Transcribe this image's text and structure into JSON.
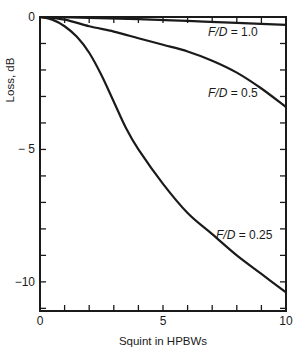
{
  "chart_data": {
    "type": "line",
    "title": "",
    "xlabel": "Squint in HPBWs",
    "ylabel": "Loss, dB",
    "xlim": [
      0,
      10
    ],
    "ylim": [
      -11.1,
      0
    ],
    "x_ticks": [
      0,
      5,
      10
    ],
    "x_tick_labels": [
      "0",
      "5",
      "10"
    ],
    "x_minor_step": 1,
    "y_ticks": [
      0,
      -5,
      -10
    ],
    "y_tick_labels": [
      "0",
      "− 5",
      "−10"
    ],
    "y_minor_step": 1,
    "grid": false,
    "legend": "inline labels",
    "series": [
      {
        "name": "F/D = 1.0",
        "label_italic": "F/D",
        "label_value": " = 1.0",
        "x": [
          0,
          2,
          4,
          6,
          8,
          10
        ],
        "values": [
          0,
          -0.03,
          -0.08,
          -0.15,
          -0.22,
          -0.3
        ],
        "label_pos": [
          208,
          36
        ]
      },
      {
        "name": "F/D = 0.5",
        "label_italic": "F/D",
        "label_value": " = 0.5",
        "x": [
          0,
          1,
          2,
          3,
          4,
          5,
          6,
          7,
          8,
          9,
          10
        ],
        "values": [
          0,
          -0.1,
          -0.35,
          -0.55,
          -0.8,
          -1.05,
          -1.3,
          -1.65,
          -2.1,
          -2.7,
          -3.4
        ],
        "label_pos": [
          208,
          97
        ]
      },
      {
        "name": "F/D = 0.25",
        "label_italic": "F/D",
        "label_value": " = 0.25",
        "x": [
          0,
          0.5,
          1,
          1.5,
          2,
          2.5,
          3,
          3.5,
          4,
          5,
          6,
          7,
          8,
          9,
          10
        ],
        "values": [
          0,
          -0.1,
          -0.35,
          -0.75,
          -1.35,
          -2.2,
          -3.2,
          -4.2,
          -5.0,
          -6.3,
          -7.4,
          -8.2,
          -9.0,
          -9.7,
          -10.4
        ],
        "label_pos": [
          216,
          239
        ]
      }
    ],
    "colors": {
      "line": "#1a1a1a",
      "axis": "#1a1a1a",
      "background": "#ffffff"
    }
  }
}
